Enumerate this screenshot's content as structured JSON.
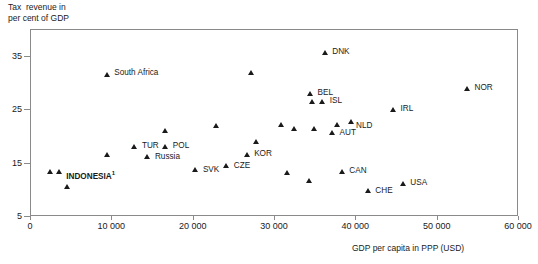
{
  "chart_data": {
    "type": "scatter",
    "title": "",
    "ylabel": "Tax  revenue in\nper cent of GDP",
    "xlabel": "GDP per capita in PPP (USD)",
    "xlim": [
      0,
      60000
    ],
    "ylim": [
      5,
      40
    ],
    "xticks": [
      0,
      10000,
      20000,
      30000,
      40000,
      50000,
      60000
    ],
    "xticklabels": [
      "0",
      "10 000",
      "20 000",
      "30 000",
      "40 000",
      "50 000",
      "60 000"
    ],
    "yticks": [
      5,
      15,
      25,
      35
    ],
    "yticklabels": [
      "5",
      "15",
      "25",
      "35"
    ],
    "grid": false,
    "legend": null,
    "points": [
      {
        "label": "India",
        "x": 2500,
        "y": 13.3,
        "lx": -5,
        "ly": -13,
        "bold": false
      },
      {
        "label": "INDONESIA",
        "x": 3600,
        "y": 13.3,
        "lx": 7,
        "ly": -1,
        "bold": true,
        "sup": "1"
      },
      {
        "label": "China",
        "x": 4600,
        "y": 10.5,
        "lx": -11,
        "ly": 5,
        "bold": false,
        "sup": "2"
      },
      {
        "label": "Brazil",
        "x": 9600,
        "y": 16.4,
        "lx": -23,
        "ly": -10,
        "bold": false
      },
      {
        "label": "South Africa",
        "x": 9500,
        "y": 31.5,
        "lx": 7,
        "ly": -4,
        "bold": false
      },
      {
        "label": "TUR",
        "x": 12900,
        "y": 18.0,
        "lx": 7,
        "ly": -4,
        "bold": false
      },
      {
        "label": "Russia",
        "x": 14500,
        "y": 16.0,
        "lx": 7,
        "ly": -3,
        "bold": false
      },
      {
        "label": "HUN",
        "x": 16700,
        "y": 21.0,
        "lx": -22,
        "ly": -4,
        "bold": false
      },
      {
        "label": "POL",
        "x": 16700,
        "y": 18.0,
        "lx": 7,
        "ly": -4,
        "bold": false
      },
      {
        "label": "SVK",
        "x": 20400,
        "y": 13.6,
        "lx": 7,
        "ly": -3,
        "bold": false
      },
      {
        "label": "PRT",
        "x": 22900,
        "y": 21.9,
        "lx": -22,
        "ly": -5,
        "bold": false
      },
      {
        "label": "CZE",
        "x": 24200,
        "y": 14.4,
        "lx": 7,
        "ly": -3,
        "bold": false
      },
      {
        "label": "KOR",
        "x": 26700,
        "y": 16.4,
        "lx": 7,
        "ly": -4,
        "bold": false
      },
      {
        "label": "GRC",
        "x": 27900,
        "y": 18.8,
        "lx": -11,
        "ly": 3,
        "bold": false
      },
      {
        "label": "NZL",
        "x": 27200,
        "y": 31.8,
        "lx": -9,
        "ly": -13,
        "bold": false
      },
      {
        "label": "FRA",
        "x": 30900,
        "y": 22.1,
        "lx": -20,
        "ly": -1,
        "bold": false
      },
      {
        "label": "ITA",
        "x": 32500,
        "y": 21.4,
        "lx": -6,
        "ly": -11,
        "bold": false
      },
      {
        "label": "DNK",
        "x": 36300,
        "y": 35.5,
        "lx": 7,
        "ly": -4,
        "bold": false
      },
      {
        "label": "GBR",
        "x": 34700,
        "y": 26.4,
        "lx": -6,
        "ly": -13,
        "bold": false
      },
      {
        "label": "ISL",
        "x": 36000,
        "y": 26.4,
        "lx": 7,
        "ly": -4,
        "bold": false
      },
      {
        "label": "BEL",
        "x": 34500,
        "y": 27.9,
        "lx": 7,
        "ly": -4,
        "bold": false
      },
      {
        "label": "FIN",
        "x": 35000,
        "y": 21.4,
        "lx": -6,
        "ly": -11,
        "bold": false
      },
      {
        "label": "AUS",
        "x": 37800,
        "y": 22.0,
        "lx": -7,
        "ly": 2,
        "bold": false
      },
      {
        "label": "NLD",
        "x": 39600,
        "y": 22.6,
        "lx": 4,
        "ly": 1,
        "bold": false
      },
      {
        "label": "AUT",
        "x": 37200,
        "y": 20.6,
        "lx": 7,
        "ly": -3,
        "bold": false
      },
      {
        "label": "ESP",
        "x": 31700,
        "y": 13.0,
        "lx": -9,
        "ly": 4,
        "bold": false
      },
      {
        "label": "DEU",
        "x": 34400,
        "y": 11.5,
        "lx": -9,
        "ly": -12,
        "bold": false
      },
      {
        "label": "CAN",
        "x": 38400,
        "y": 13.2,
        "lx": 7,
        "ly": -4,
        "bold": false
      },
      {
        "label": "CHE",
        "x": 41600,
        "y": 9.7,
        "lx": 7,
        "ly": -3,
        "bold": false
      },
      {
        "label": "USA",
        "x": 45900,
        "y": 11.0,
        "lx": 7,
        "ly": -4,
        "bold": false
      },
      {
        "label": "IRL",
        "x": 44700,
        "y": 24.8,
        "lx": 7,
        "ly": -4,
        "bold": false
      },
      {
        "label": "NOR",
        "x": 53800,
        "y": 28.8,
        "lx": 7,
        "ly": -4,
        "bold": false
      }
    ]
  }
}
